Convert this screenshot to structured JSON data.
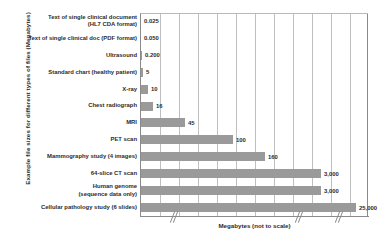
{
  "chart_data": {
    "type": "bar",
    "orientation": "horizontal",
    "title": "",
    "xlabel": "Megabytes (not to scale)",
    "ylabel": "Example file sizes for different types of files (Megabytes)",
    "note": "not to scale",
    "grid": true,
    "legend": false,
    "bar_color": "#9a9a9a",
    "axis_color": "#8a8a8a",
    "gridline_color": "#bfbfbf",
    "gridline_count": 11,
    "axis_breaks": 3,
    "categories": [
      "Text of single clinical document (HL7 CDA format)",
      "Text of single clinical doc (PDF format)",
      "Ultrasound",
      "Standard chart (healthy patient)",
      "X-ray",
      "Chest radiograph",
      "MRI",
      "PET scan",
      "Mammography study (4 images)",
      "64-slice CT scan",
      "Human genome (sequence data only)",
      "Cellular pathology study (6 slides)"
    ],
    "values": [
      0.025,
      0.05,
      0.2,
      5,
      10,
      16,
      45,
      100,
      160,
      3000,
      3000,
      25000
    ],
    "value_labels": [
      "0.025",
      "0.050",
      "0.200",
      "5",
      "10",
      "16",
      "45",
      "100",
      "160",
      "3,000",
      "3,000",
      "25,000"
    ],
    "bars": [
      {
        "label_line1": "Text of single clinical document",
        "label_line2": "(HL7 CDA format)",
        "value": 0.025,
        "value_label": "0.025",
        "bar_px": 0
      },
      {
        "label_line1": "Text of single clinical doc (PDF format)",
        "label_line2": "",
        "value": 0.05,
        "value_label": "0.050",
        "bar_px": 0
      },
      {
        "label_line1": "Ultrasound",
        "label_line2": "",
        "value": 0.2,
        "value_label": "0.200",
        "bar_px": 1
      },
      {
        "label_line1": "Standard chart (healthy patient)",
        "label_line2": "",
        "value": 5,
        "value_label": "5",
        "bar_px": 2
      },
      {
        "label_line1": "X-ray",
        "label_line2": "",
        "value": 10,
        "value_label": "10",
        "bar_px": 7
      },
      {
        "label_line1": "Chest radiograph",
        "label_line2": "",
        "value": 16,
        "value_label": "16",
        "bar_px": 12
      },
      {
        "label_line1": "MRI",
        "label_line2": "",
        "value": 45,
        "value_label": "45",
        "bar_px": 44
      },
      {
        "label_line1": "PET scan",
        "label_line2": "",
        "value": 100,
        "value_label": "100",
        "bar_px": 92
      },
      {
        "label_line1": "Mammography study (4 images)",
        "label_line2": "",
        "value": 160,
        "value_label": "160",
        "bar_px": 124
      },
      {
        "label_line1": "64-slice CT scan",
        "label_line2": "",
        "value": 3000,
        "value_label": "3,000",
        "bar_px": 180
      },
      {
        "label_line1": "Human genome",
        "label_line2": "(sequence data only)",
        "value": 3000,
        "value_label": "3,000",
        "bar_px": 180
      },
      {
        "label_line1": "Cellular pathology study (6 slides)",
        "label_line2": "",
        "value": 25000,
        "value_label": "25,000",
        "bar_px": 215
      }
    ]
  }
}
